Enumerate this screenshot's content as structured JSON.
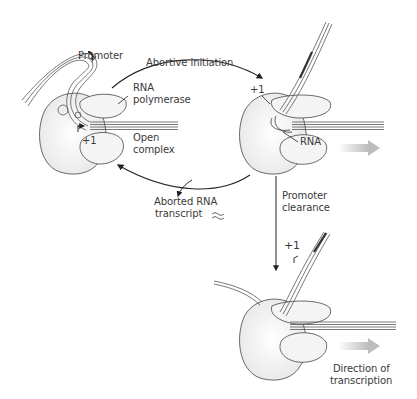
{
  "diagram": {
    "labels": {
      "promoter_top": "Promoter",
      "abortive_initiation": "Abortive initiation",
      "rna_polymerase_line1": "RNA",
      "rna_polymerase_line2": "polymerase",
      "open_complex_line1": "Open",
      "open_complex_line2": "complex",
      "plus1_left": "+1",
      "plus1_right": "+1",
      "rna": "RNA",
      "aborted_line1": "Aborted RNA",
      "aborted_line2": "transcript",
      "promoter_clearance_line1": "Promoter",
      "promoter_clearance_line2": "clearance",
      "plus1_bottom": "+1",
      "direction_line1": "Direction of",
      "direction_line2": "transcription"
    },
    "stages": [
      {
        "name": "open-complex",
        "label": "Open complex"
      },
      {
        "name": "abortive-initiation",
        "label": "Abortive initiation"
      },
      {
        "name": "promoter-clearance",
        "label": "Promoter clearance"
      }
    ],
    "colors": {
      "enzyme_fill": "#f2f2f2",
      "outline": "#444444",
      "dna_dark": "#555555",
      "arrow_gray": "#c8c8c8",
      "text": "#3a3a3a"
    }
  }
}
